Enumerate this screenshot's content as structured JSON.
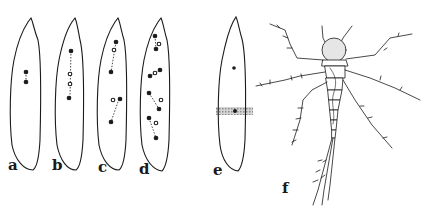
{
  "figure": {
    "panels": [
      {
        "id": "a",
        "label": "a",
        "description": "leaf outline with two connected dots"
      },
      {
        "id": "b",
        "label": "b",
        "description": "leaf outline with filled and open dots in a vertical dotted line"
      },
      {
        "id": "c",
        "label": "c",
        "description": "leaf outline with two pairs of connected dots"
      },
      {
        "id": "d",
        "label": "d",
        "description": "leaf outline with multiple pairs of filled and open dots"
      },
      {
        "id": "e",
        "label": "e",
        "description": "leaf outline with dots and a shaded horizontal band"
      },
      {
        "id": "f",
        "label": "f",
        "description": "line drawing of an insect nymph with legs, antennae and tail filaments"
      }
    ]
  },
  "colors": {
    "ink": "#1a1a1a",
    "band": "#bdbdbd",
    "background": "#ffffff"
  }
}
